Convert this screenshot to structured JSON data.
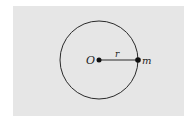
{
  "diagram": {
    "background_color": "#e6e6e6",
    "stroke_color": "#2a2a2a",
    "circle": {
      "cx": 99,
      "cy": 60,
      "r": 39
    },
    "center_point": {
      "label": "O",
      "x": 99,
      "y": 60
    },
    "mass_point": {
      "label": "m",
      "x": 138,
      "y": 60
    },
    "radius_label": "r"
  }
}
